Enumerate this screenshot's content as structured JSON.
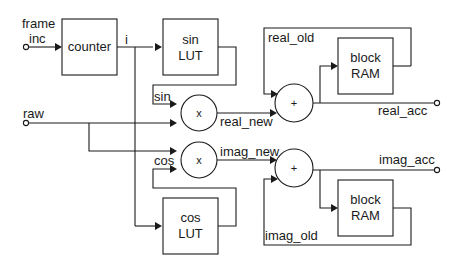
{
  "diagram": {
    "type": "block-diagram",
    "inputs": {
      "frame_inc_line1": "frame",
      "frame_inc_line2": "inc",
      "raw": "raw"
    },
    "blocks": {
      "counter": "counter",
      "sin_lut_line1": "sin",
      "sin_lut_line2": "LUT",
      "cos_lut_line1": "cos",
      "cos_lut_line2": "LUT",
      "ram_real_line1": "block",
      "ram_real_line2": "RAM",
      "ram_imag_line1": "block",
      "ram_imag_line2": "RAM"
    },
    "operators": {
      "mult_real": "x",
      "mult_imag": "x",
      "add_real": "+",
      "add_imag": "+"
    },
    "signals": {
      "i": "i",
      "sin": "sin",
      "cos": "cos",
      "real_new": "real_new",
      "imag_new": "imag_new",
      "real_old": "real_old",
      "imag_old": "imag_old"
    },
    "outputs": {
      "real_acc": "real_acc",
      "imag_acc": "imag_acc"
    }
  }
}
